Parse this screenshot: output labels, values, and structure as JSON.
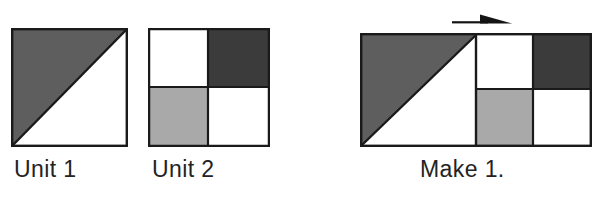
{
  "page": {
    "background_color": "#ffffff",
    "width": 616,
    "height": 200
  },
  "palette": {
    "dark_gray": "#3b3b3b",
    "medium_gray": "#5e5e5e",
    "light_gray": "#a9a9a9",
    "white": "#ffffff",
    "outline": "#1a1a1a",
    "text": "#232323"
  },
  "figures": [
    {
      "id": "unit1",
      "caption": "Unit 1",
      "type": "half-square-triangle",
      "patches": [
        {
          "name": "upper-left-triangle",
          "color": "#5e5e5e",
          "fill": "medium-gray"
        },
        {
          "name": "lower-right-triangle",
          "color": "#ffffff",
          "fill": "white"
        }
      ]
    },
    {
      "id": "unit2",
      "caption": "Unit 2",
      "type": "four-patch",
      "patches": [
        {
          "name": "top-left-square",
          "color": "#ffffff",
          "fill": "white"
        },
        {
          "name": "top-right-square",
          "color": "#3b3b3b",
          "fill": "dark-gray"
        },
        {
          "name": "bottom-left-square",
          "color": "#a9a9a9",
          "fill": "light-gray"
        },
        {
          "name": "bottom-right-square",
          "color": "#ffffff",
          "fill": "white"
        }
      ]
    },
    {
      "id": "make1",
      "caption": "Make 1.",
      "type": "joined-unit",
      "patches": [
        {
          "name": "left-upper-triangle",
          "color": "#5e5e5e",
          "fill": "medium-gray"
        },
        {
          "name": "left-lower-triangle",
          "color": "#ffffff",
          "fill": "white"
        },
        {
          "name": "right-top-left-square",
          "color": "#ffffff",
          "fill": "white"
        },
        {
          "name": "right-top-right-square",
          "color": "#3b3b3b",
          "fill": "dark-gray"
        },
        {
          "name": "right-bottom-left-square",
          "color": "#a9a9a9",
          "fill": "light-gray"
        },
        {
          "name": "right-bottom-right-square",
          "color": "#ffffff",
          "fill": "white"
        }
      ]
    }
  ],
  "annotations": {
    "arrow": {
      "name": "direction-arrow",
      "direction": "right",
      "color": "#141414"
    }
  },
  "captions": {
    "unit1": "Unit 1",
    "unit2": "Unit 2",
    "make1": "Make 1."
  }
}
